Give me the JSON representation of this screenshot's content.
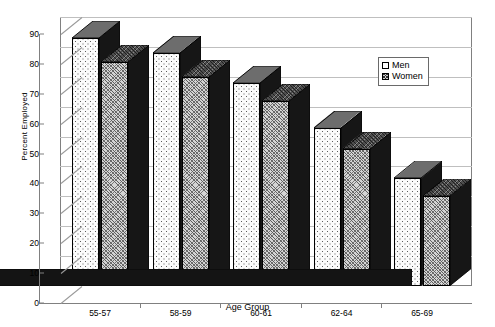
{
  "chart_data": {
    "type": "bar",
    "title": "",
    "xlabel": "Age Group",
    "ylabel": "Percent Employed",
    "categories": [
      "55-57",
      "58-59",
      "60-61",
      "62-64",
      "65-69"
    ],
    "series": [
      {
        "name": "Men",
        "values": [
          83,
          78,
          68,
          53,
          36
        ]
      },
      {
        "name": "Women",
        "values": [
          75,
          70,
          62,
          46,
          30
        ]
      }
    ],
    "ylim": [
      0,
      90
    ],
    "yticks": [
      0,
      10,
      20,
      30,
      40,
      50,
      60,
      70,
      80,
      90
    ],
    "ytick_labels": [
      "0",
      "10",
      "20",
      "30",
      "40",
      "50",
      "60",
      "70",
      "80",
      "90"
    ],
    "grid": true,
    "legend_position": "upper right",
    "legend_entries": [
      "Men",
      "Women"
    ],
    "three_d": true
  },
  "legend": {
    "items": [
      {
        "label": "Men",
        "swatch": "men-swatch-icon"
      },
      {
        "label": "Women",
        "swatch": "women-swatch-icon"
      }
    ]
  }
}
